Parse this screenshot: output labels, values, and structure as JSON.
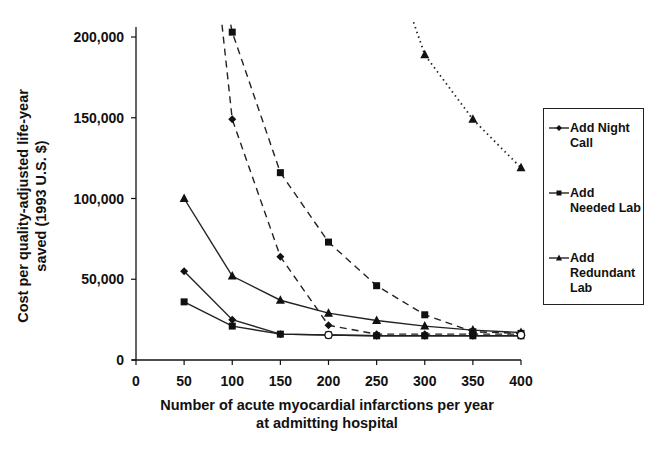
{
  "chart_data": {
    "type": "line",
    "title": "",
    "xlabel": "Number of acute myocardial infarctions per year at admitting hospital",
    "xlabel_lines": [
      "Number of acute myocardial infarctions per year",
      "at admitting hospital"
    ],
    "ylabel": "Cost per quality-adjusted life-year saved (1993 U.S. $)",
    "ylabel_lines": [
      "Cost per quality-adjusted life-year",
      "saved (1993 U.S. $)"
    ],
    "x": [
      50,
      100,
      150,
      200,
      250,
      300,
      350,
      400
    ],
    "xticks": [
      0,
      50,
      100,
      150,
      200,
      250,
      300,
      350,
      400
    ],
    "xtick_labels": [
      "0",
      "50",
      "100",
      "150",
      "200",
      "250",
      "300",
      "350",
      "400"
    ],
    "yticks": [
      0,
      50000,
      100000,
      150000,
      200000
    ],
    "ytick_labels": [
      "0",
      "50,000",
      "100,000",
      "150,000",
      "200,000"
    ],
    "xlim": [
      0,
      400
    ],
    "ylim": [
      0,
      200000
    ],
    "grid": false,
    "legend_position": "right",
    "series": [
      {
        "name": "Add Night Call",
        "marker": "diamond",
        "line": "solid",
        "values": [
          55000,
          25000,
          16000,
          15500,
          15000,
          15000,
          15000,
          15000
        ]
      },
      {
        "name": "Add Needed Lab",
        "marker": "square",
        "line": "solid",
        "values": [
          36000,
          21000,
          16000,
          15500,
          15000,
          15000,
          15000,
          15000
        ]
      },
      {
        "name": "Add Redundant Lab",
        "marker": "triangle",
        "line": "solid",
        "values": [
          100000,
          52000,
          37000,
          29000,
          24500,
          21000,
          18500,
          17000
        ]
      },
      {
        "name": "Add Night Call",
        "marker": "diamond",
        "line": "dashed",
        "values": [
          null,
          149000,
          64000,
          21500,
          16000,
          16000,
          16000,
          16000
        ]
      },
      {
        "name": "Add Needed Lab",
        "marker": "square",
        "line": "dashed",
        "values": [
          null,
          203000,
          116000,
          73000,
          46000,
          28000,
          17500,
          16500
        ]
      },
      {
        "name": "Add Redundant Lab",
        "marker": "triangle",
        "line": "dotted",
        "values": [
          null,
          null,
          null,
          null,
          null,
          189000,
          149000,
          119000
        ]
      }
    ]
  },
  "legend": {
    "items": [
      {
        "label": "Add Night Call",
        "marker": "diamond"
      },
      {
        "label": "Add Needed Lab",
        "marker": "square"
      },
      {
        "label": "Add Redundant Lab",
        "marker": "triangle"
      }
    ]
  }
}
